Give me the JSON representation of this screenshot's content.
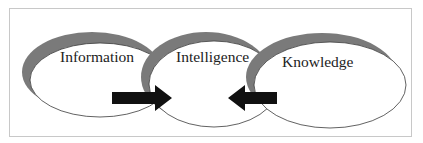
{
  "diagram": {
    "nodes": [
      {
        "id": "information",
        "label": "Information"
      },
      {
        "id": "intelligence",
        "label": "Intelligence"
      },
      {
        "id": "knowledge",
        "label": "Knowledge"
      }
    ],
    "arrows": [
      {
        "from": "information",
        "to": "intelligence",
        "direction": "right"
      },
      {
        "from": "knowledge",
        "to": "intelligence",
        "direction": "left"
      }
    ],
    "colors": {
      "shadow": "#7a7a7a",
      "outline": "#3a3a3a",
      "arrow": "#111111",
      "frame": "#c8c8c8"
    }
  }
}
